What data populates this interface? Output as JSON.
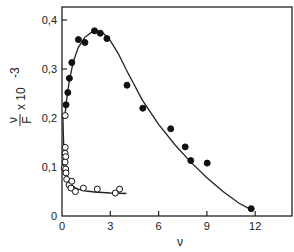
{
  "chart_data": {
    "type": "scatter",
    "title": "",
    "xlabel": "ν",
    "ylabel": "ν/F × 10^-3",
    "ylabel_parts": {
      "numerator": "ν",
      "denominator": "F",
      "multiplier": "x 10",
      "exponent": "-3"
    },
    "xlim": [
      0,
      14.3
    ],
    "ylim": [
      0,
      0.43
    ],
    "x_ticks": [
      0,
      3,
      6,
      9,
      12
    ],
    "x_tick_labels": [
      "0",
      "3",
      "6",
      "9",
      "12"
    ],
    "y_ticks": [
      0,
      0.1,
      0.2,
      0.3,
      0.4
    ],
    "y_tick_labels": [
      "0",
      "0,1",
      "0,2",
      "0,3",
      "0,4"
    ],
    "grid": false,
    "legend": null,
    "series": [
      {
        "name": "filled circles",
        "marker": "filled-circle",
        "points": [
          [
            0.25,
            0.227
          ],
          [
            0.36,
            0.252
          ],
          [
            0.46,
            0.281
          ],
          [
            0.61,
            0.313
          ],
          [
            1.02,
            0.36
          ],
          [
            1.42,
            0.354
          ],
          [
            2.02,
            0.378
          ],
          [
            2.38,
            0.373
          ],
          [
            2.79,
            0.362
          ],
          [
            4.04,
            0.267
          ],
          [
            5.02,
            0.22
          ],
          [
            6.75,
            0.178
          ],
          [
            7.65,
            0.141
          ],
          [
            8.0,
            0.113
          ],
          [
            9.02,
            0.108
          ],
          [
            11.75,
            0.015
          ]
        ],
        "fit_curve": [
          [
            0.2,
            0.21
          ],
          [
            0.3,
            0.24
          ],
          [
            0.45,
            0.275
          ],
          [
            0.7,
            0.315
          ],
          [
            1.0,
            0.343
          ],
          [
            1.4,
            0.364
          ],
          [
            1.8,
            0.374
          ],
          [
            2.2,
            0.377
          ],
          [
            2.6,
            0.372
          ],
          [
            3.0,
            0.358
          ],
          [
            3.5,
            0.331
          ],
          [
            4.0,
            0.298
          ],
          [
            5.0,
            0.236
          ],
          [
            6.0,
            0.187
          ],
          [
            7.0,
            0.146
          ],
          [
            8.0,
            0.11
          ],
          [
            9.0,
            0.078
          ],
          [
            10.0,
            0.05
          ],
          [
            11.0,
            0.026
          ],
          [
            11.8,
            0.012
          ]
        ]
      },
      {
        "name": "open circles",
        "marker": "open-circle",
        "points": [
          [
            0.2,
            0.205
          ],
          [
            0.2,
            0.14
          ],
          [
            0.19,
            0.128
          ],
          [
            0.23,
            0.121
          ],
          [
            0.19,
            0.11
          ],
          [
            0.14,
            0.098
          ],
          [
            0.23,
            0.096
          ],
          [
            0.25,
            0.088
          ],
          [
            0.29,
            0.075
          ],
          [
            0.44,
            0.063
          ],
          [
            0.61,
            0.071
          ],
          [
            0.56,
            0.057
          ],
          [
            0.83,
            0.05
          ],
          [
            1.33,
            0.057
          ],
          [
            2.19,
            0.055
          ],
          [
            3.31,
            0.047
          ],
          [
            3.58,
            0.055
          ]
        ],
        "fit_curve": [
          [
            0.05,
            0.21
          ],
          [
            0.1,
            0.15
          ],
          [
            0.15,
            0.118
          ],
          [
            0.2,
            0.1
          ],
          [
            0.3,
            0.083
          ],
          [
            0.45,
            0.07
          ],
          [
            0.6,
            0.063
          ],
          [
            0.8,
            0.058
          ],
          [
            1.0,
            0.055
          ],
          [
            1.5,
            0.051
          ],
          [
            2.0,
            0.049
          ],
          [
            3.0,
            0.047
          ],
          [
            4.0,
            0.046
          ]
        ]
      }
    ]
  }
}
